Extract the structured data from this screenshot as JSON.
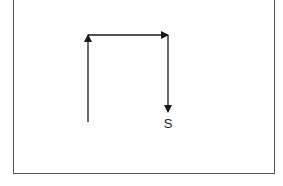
{
  "diagram": {
    "label": "S",
    "colors": {
      "stroke": "#1a1a1a",
      "frame": "#555555",
      "background": "#ffffff"
    },
    "arrows": [
      {
        "name": "up-arrow",
        "from": [
          88,
          122
        ],
        "to": [
          88,
          35
        ]
      },
      {
        "name": "right-arrow",
        "from": [
          88,
          35
        ],
        "to": [
          168,
          35
        ]
      },
      {
        "name": "down-arrow",
        "from": [
          168,
          35
        ],
        "to": [
          168,
          112
        ]
      }
    ]
  }
}
